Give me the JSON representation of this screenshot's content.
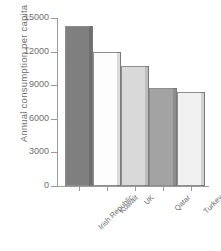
{
  "chart_data": {
    "type": "bar",
    "title": "",
    "xlabel": "",
    "ylabel": "Annual consumption per capita",
    "categories": [
      "Irish Republic",
      "Kuwait",
      "UK",
      "Qatar",
      "Turkey"
    ],
    "values": [
      14300,
      12000,
      10700,
      8750,
      8400
    ],
    "ylim": [
      0,
      15000
    ],
    "yticks": [
      0,
      3000,
      6000,
      9000,
      12000,
      15000
    ],
    "ytick_labels": [
      "0",
      "3000",
      "6000",
      "9000",
      "12000",
      "15000"
    ],
    "grid": false,
    "legend": null,
    "bar_colors": [
      "#7f7f7f",
      "#fdfdfd",
      "#d9d9d9",
      "#a3a3a3",
      "#f1f1f1"
    ],
    "bar_edge_color": "#8d8d8d",
    "axis_color": "#9a9a9a",
    "text_color": "#6e6e6e",
    "background": "#ffffff"
  },
  "axis": {
    "y_title": "Annual consumption per capita"
  },
  "ticks": {
    "y": [
      {
        "label": "15000",
        "value": 15000
      },
      {
        "label": "12000",
        "value": 12000
      },
      {
        "label": "9000",
        "value": 9000
      },
      {
        "label": "6000",
        "value": 6000
      },
      {
        "label": "3000",
        "value": 3000
      },
      {
        "label": "0",
        "value": 0
      }
    ]
  },
  "bars": [
    {
      "label": "Irish Republic",
      "value": 14300,
      "color": "#7f7f7f"
    },
    {
      "label": "Kuwait",
      "value": 12000,
      "color": "#fdfdfd"
    },
    {
      "label": "UK",
      "value": 10700,
      "color": "#d9d9d9"
    },
    {
      "label": "Qatar",
      "value": 8750,
      "color": "#a3a3a3"
    },
    {
      "label": "Turkey",
      "value": 8400,
      "color": "#f1f1f1"
    }
  ]
}
